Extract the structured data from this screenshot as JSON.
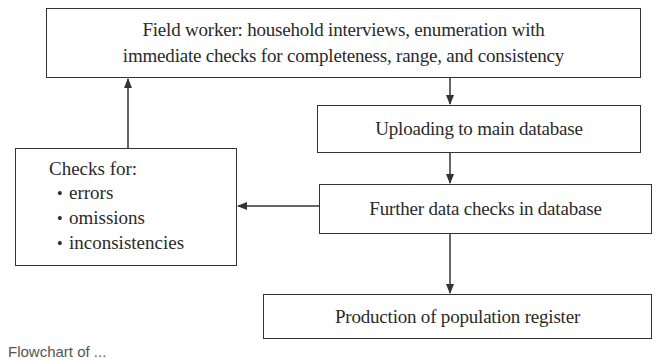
{
  "nodes": {
    "field_worker": {
      "line1": "Field worker: household interviews, enumeration with",
      "line2": "immediate checks for completeness, range, and consistency"
    },
    "uploading": {
      "label": "Uploading to main database"
    },
    "further_checks": {
      "label": "Further data checks in database"
    },
    "checks_for": {
      "title": "Checks for:",
      "items": [
        "errors",
        "omissions",
        "inconsistencies"
      ],
      "bullet": "•"
    },
    "production": {
      "label": "Production of population register"
    }
  },
  "edges": [
    {
      "from": "field_worker",
      "to": "uploading"
    },
    {
      "from": "uploading",
      "to": "further_checks"
    },
    {
      "from": "further_checks",
      "to": "checks_for"
    },
    {
      "from": "checks_for",
      "to": "field_worker"
    },
    {
      "from": "further_checks",
      "to": "production"
    }
  ],
  "colors": {
    "line": "#333333",
    "text": "#2a2a2a",
    "background": "#ffffff"
  },
  "caption": "Flowchart of ..."
}
